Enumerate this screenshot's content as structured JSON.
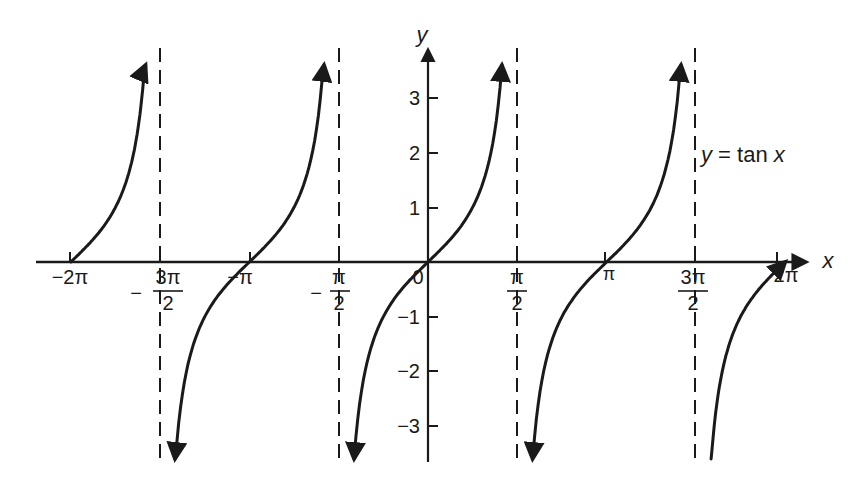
{
  "chart_data": {
    "type": "line",
    "title": "",
    "function_label": "y = tan x",
    "xlabel": "x",
    "ylabel": "y",
    "xlim_radians": [
      -6.2832,
      6.2832
    ],
    "ylim": [
      -3.7,
      3.7
    ],
    "grid": false,
    "legend": "none; inline label 'y = tan x' right of asymptote x = 3π/2",
    "x_tick_labels": [
      "−2π",
      "−3π/2",
      "−π",
      "−π/2",
      "0",
      "π/2",
      "π",
      "3π/2",
      "2π"
    ],
    "x_tick_values": [
      -6.2832,
      -4.7124,
      -3.1416,
      -1.5708,
      0,
      1.5708,
      3.1416,
      4.7124,
      6.2832
    ],
    "y_tick_labels": [
      "−3",
      "−2",
      "−1",
      "1",
      "2",
      "3"
    ],
    "y_tick_values": [
      -3,
      -2,
      -1,
      1,
      2,
      3
    ],
    "asymptotes": [
      "x = −3π/2",
      "x = −π/2",
      "x = π/2",
      "x = 3π/2"
    ],
    "asymptote_values": [
      -4.7124,
      -1.5708,
      1.5708,
      4.7124
    ],
    "zeros": [
      "−2π",
      "−π",
      "0",
      "π",
      "2π"
    ],
    "series": [
      {
        "name": "tan x",
        "branches": [
          {
            "domain": "[−2π, −3π/2)",
            "x_start": -6.2832,
            "x_end": -4.97,
            "y_range": [
              0,
              3.6
            ],
            "ends_with_arrow": "up"
          },
          {
            "domain": "(−3π/2, −π/2)",
            "x_start": -4.45,
            "x_end": -1.83,
            "y_range": [
              -3.6,
              3.6
            ],
            "ends_with_arrow": "both"
          },
          {
            "domain": "(−π/2, π/2)",
            "x_start": -1.3,
            "x_end": 1.3,
            "y_range": [
              -3.6,
              3.6
            ],
            "ends_with_arrow": "both"
          },
          {
            "domain": "(π/2, 3π/2)",
            "x_start": 1.84,
            "x_end": 4.45,
            "y_range": [
              -3.6,
              3.6
            ],
            "ends_with_arrow": "both"
          },
          {
            "domain": "(3π/2, 2π]",
            "x_start": 4.98,
            "x_end": 6.2832,
            "y_range": [
              -3.6,
              0
            ],
            "ends_with_arrow": "down"
          }
        ],
        "sample_points": [
          {
            "x": 0,
            "y": 0
          },
          {
            "x": 0.7854,
            "y": 1
          },
          {
            "x": -0.7854,
            "y": -1
          },
          {
            "x": 1.249,
            "y": 3
          },
          {
            "x": -1.249,
            "y": -3
          },
          {
            "x": 3.1416,
            "y": 0
          },
          {
            "x": -3.1416,
            "y": 0
          }
        ]
      }
    ]
  },
  "labels": {
    "x_axis": "x",
    "y_axis": "y",
    "function": "y = tan x",
    "origin": "0",
    "x_ticks": {
      "neg_2pi": "−2π",
      "neg_3pi_2_sign": "−",
      "neg_3pi_2_num": "3π",
      "neg_3pi_2_den": "2",
      "neg_pi": "−π",
      "neg_pi_2_sign": "−",
      "neg_pi_2_num": "π",
      "neg_pi_2_den": "2",
      "pi_2_num": "π",
      "pi_2_den": "2",
      "pi": "π",
      "three_pi_2_num": "3π",
      "three_pi_2_den": "2",
      "two_pi": "2π"
    },
    "y_ticks": {
      "p3": "3",
      "p2": "2",
      "p1": "1",
      "m1": "−1",
      "m2": "−2",
      "m3": "−3"
    }
  },
  "colors": {
    "ink": "#1a1a1a",
    "background": "#ffffff"
  }
}
